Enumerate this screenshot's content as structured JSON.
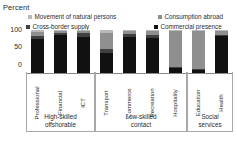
{
  "axis_unit_label": "Percent",
  "legend": {
    "items": [
      {
        "id": "movement-of-natural-persons",
        "label": "Movement of natural persons",
        "color": "#b9b9b9"
      },
      {
        "id": "consumption-abroad",
        "label": "Consumption abroad",
        "color": "#8f8f8f"
      },
      {
        "id": "cross-border-supply",
        "label": "Cross-border supply",
        "color": "#404040"
      },
      {
        "id": "commercial-presence",
        "label": "Commercial presence",
        "color": "#111111"
      }
    ]
  },
  "y_axis": {
    "ticks": [
      "100",
      "50",
      "0"
    ]
  },
  "groups": [
    {
      "id": "high-skilled-offshorable",
      "line1": "High-skilled",
      "line2": "offshorable",
      "span": 3
    },
    {
      "id": "low-skilled-contact",
      "line1": "Low-skilled",
      "line2": "contact",
      "span": 4
    },
    {
      "id": "social-services",
      "line1": "Social",
      "line2": "services",
      "span": 2
    }
  ],
  "chart_data": {
    "type": "bar",
    "subtype": "stacked-column-100",
    "title": "",
    "xlabel": "",
    "ylabel": "Percent",
    "ylim": [
      0,
      100
    ],
    "yticks": [
      0,
      50,
      100
    ],
    "grid": false,
    "legend_position": "top",
    "categories": [
      "Professional",
      "Financial",
      "ICT",
      "Transport",
      "Commerce",
      "Recreation",
      "Hospitality",
      "Education",
      "Health"
    ],
    "category_groups": [
      "High-skilled offshorable",
      "High-skilled offshorable",
      "High-skilled offshorable",
      "Low-skilled contact",
      "Low-skilled contact",
      "Low-skilled contact",
      "Low-skilled contact",
      "Social services",
      "Social services"
    ],
    "series": [
      {
        "name": "Commercial presence",
        "color": "#111111",
        "values": [
          80,
          88,
          83,
          47,
          85,
          82,
          13,
          9,
          86
        ]
      },
      {
        "name": "Cross-border supply",
        "color": "#404040",
        "values": [
          6,
          5,
          10,
          9,
          6,
          6,
          3,
          3,
          3
        ]
      },
      {
        "name": "Consumption abroad",
        "color": "#8f8f8f",
        "values": [
          9,
          5,
          5,
          38,
          7,
          10,
          82,
          86,
          9
        ]
      },
      {
        "name": "Movement of natural persons",
        "color": "#b9b9b9",
        "values": [
          5,
          2,
          2,
          6,
          2,
          2,
          2,
          2,
          2
        ]
      }
    ]
  }
}
